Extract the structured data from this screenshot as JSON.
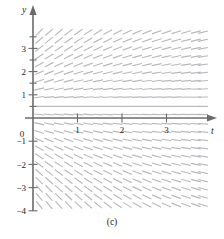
{
  "figure": {
    "caption": "(c)",
    "caption_top": 217
  },
  "axes": {
    "x_axis_label": "t",
    "y_axis_label": "y",
    "x_label_pos": {
      "x": 211,
      "y": 134
    },
    "y_label_pos": {
      "x": 22,
      "y": 13
    },
    "origin_label": "0",
    "origin_label_pos": {
      "x": 22,
      "y": 137
    },
    "x_ticks": [
      {
        "label": "1",
        "value": 1
      },
      {
        "label": "2",
        "value": 2
      },
      {
        "label": "3",
        "value": 3
      }
    ],
    "y_ticks": [
      {
        "label": "3",
        "value": 3
      },
      {
        "label": "2",
        "value": 2
      },
      {
        "label": "1",
        "value": 1
      },
      {
        "label": "−1",
        "value": -1
      },
      {
        "label": "−2",
        "value": -2
      },
      {
        "label": "−3",
        "value": -3
      },
      {
        "label": "−4",
        "value": -4
      }
    ],
    "axis_color": "#6b6b6b",
    "x_axis_pixel_y": 118,
    "y_axis_pixel_x": 33,
    "x_origin_px": 33,
    "y_origin_px": 118,
    "px_per_unit_x": 44.5,
    "px_per_unit_y": 23.2,
    "x_axis_start_px": 25,
    "x_axis_end_px": 208,
    "y_axis_top_px": 14,
    "y_axis_bottom_px": 211
  },
  "chart_data": {
    "type": "scatter",
    "title": "",
    "subtitle": "",
    "xlabel": "t",
    "ylabel": "y",
    "xlim": [
      -0.2,
      3.9
    ],
    "ylim": [
      -4.5,
      4.2
    ],
    "grid": false,
    "legend": null,
    "plot_kind": "direction-field",
    "equilibrium_y": 0.5,
    "slope_rule": "dy/dt = k*(y - 0.5)*exp(-0.38*t)",
    "slope_gain": 0.62,
    "slope_decay": 0.38,
    "mark_color": "#b9b9bd",
    "mark_length_px": 10,
    "grid_t_values": [
      0.14,
      0.36,
      0.58,
      0.8,
      1.02,
      1.24,
      1.46,
      1.68,
      1.9,
      2.12,
      2.34,
      2.56,
      2.78,
      3.0,
      3.22,
      3.44,
      3.66,
      3.82
    ],
    "grid_y_values": [
      3.7,
      3.35,
      3.0,
      2.65,
      2.3,
      1.95,
      1.6,
      1.25,
      0.9,
      0.5,
      0.15,
      -0.25,
      -0.6,
      -0.95,
      -1.3,
      -1.65,
      -2.0,
      -2.35,
      -2.7,
      -3.05,
      -3.4,
      -3.75,
      -4.1
    ],
    "x": [
      0.14,
      0.36,
      0.58,
      0.8,
      1.02,
      1.24,
      1.46,
      1.68,
      1.9,
      2.12,
      2.34,
      2.56,
      2.78,
      3.0,
      3.22,
      3.44,
      3.66,
      3.82
    ],
    "y": [
      3.7,
      3.35,
      3.0,
      2.65,
      2.3,
      1.95,
      1.6,
      1.25,
      0.9,
      0.5,
      0.15,
      -0.25,
      -0.6,
      -0.95,
      -1.3,
      -1.65,
      -2.0,
      -2.35,
      -2.7,
      -3.05,
      -3.4,
      -3.75,
      -4.1
    ]
  }
}
